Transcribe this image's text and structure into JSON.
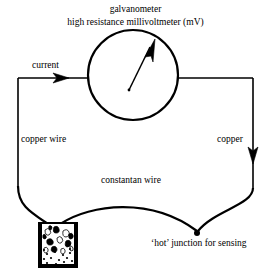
{
  "diagram": {
    "type": "thermocouple-circuit-diagram",
    "background_color": "#ffffff",
    "stroke_color": "#000000",
    "labels": {
      "title_line_1": "galvanometer",
      "title_line_2": "high resistance millivoltmeter (mV)",
      "current": "current",
      "copper_wire_left": "copper wire",
      "copper_right": "copper",
      "constantan_wire": "constantan wire",
      "hot_junction": "‘hot’ junction for sensing"
    },
    "components": {
      "galvanometer": {
        "name": "galvanometer-circle",
        "center_x": 133,
        "center_y": 75,
        "radius": 45,
        "needle_from_x": 129,
        "needle_from_y": 90,
        "needle_to_x": 154,
        "needle_to_y": 42
      },
      "ice_beaker": {
        "name": "ice-water-beaker",
        "x": 38,
        "y": 222,
        "width": 40,
        "height": 46,
        "wall_thickness": 4,
        "ice_chunk_count": 13,
        "water_dot_count": 14
      },
      "hot_junction_point": {
        "x": 197,
        "y": 233,
        "radius": 3
      },
      "current_arrow": {
        "x": 68,
        "y": 78,
        "direction": "right"
      },
      "copper_arrow": {
        "x": 253,
        "y": 160,
        "direction": "down"
      }
    }
  }
}
